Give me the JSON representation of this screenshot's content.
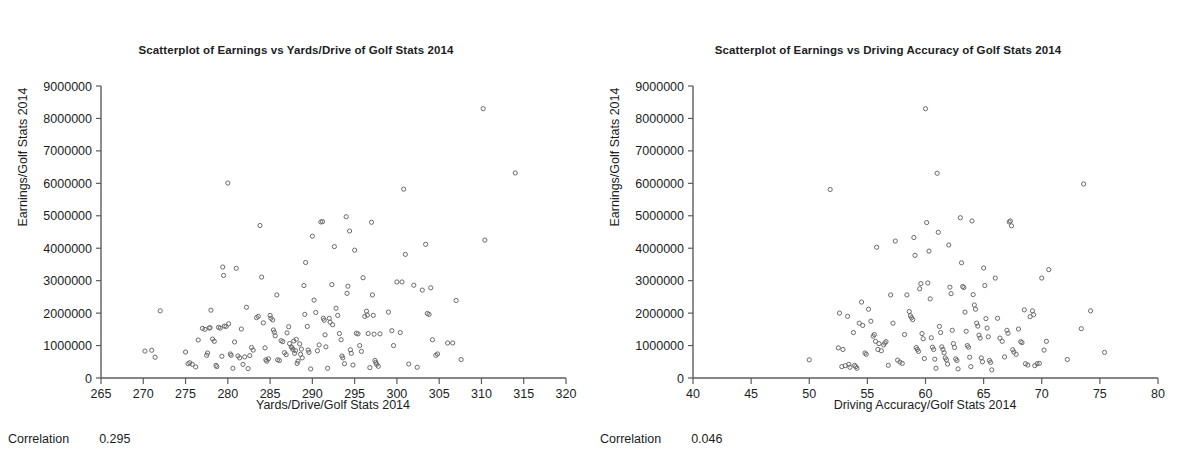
{
  "chart_data": [
    {
      "type": "scatter",
      "id": "earnings-vs-yards-drive",
      "title": "Scatterplot of Earnings vs Yards/Drive of Golf Stats 2014",
      "xlabel": "Yards/Drive/Golf Stats 2014",
      "ylabel": "Earnings/Golf Stats 2014",
      "xlim": [
        265,
        320
      ],
      "ylim": [
        0,
        9000000
      ],
      "xticks": [
        265,
        270,
        275,
        280,
        285,
        290,
        295,
        300,
        305,
        310,
        315,
        320
      ],
      "yticks": [
        0,
        1000000,
        2000000,
        3000000,
        4000000,
        5000000,
        6000000,
        7000000,
        8000000,
        9000000
      ],
      "ytick_labels": [
        "0",
        "1000000",
        "2000000",
        "3000000",
        "4000000",
        "5000000",
        "6000000",
        "7000000",
        "8000000",
        "9000000"
      ],
      "xtick_labels": [
        "265",
        "270",
        "275",
        "280",
        "285",
        "290",
        "295",
        "300",
        "305",
        "310",
        "315",
        "320"
      ],
      "grid": false,
      "legend": "none",
      "marker": "open-circle",
      "marker_color": "#6a6a6a",
      "correlation_label": "Correlation",
      "correlation_value": "0.295",
      "points": [
        [
          270.2,
          830000
        ],
        [
          271.0,
          855000
        ],
        [
          271.4,
          640000
        ],
        [
          272.0,
          2070000
        ],
        [
          275.0,
          800000
        ],
        [
          275.3,
          440000
        ],
        [
          275.5,
          470000
        ],
        [
          275.8,
          420000
        ],
        [
          276.2,
          340000
        ],
        [
          276.5,
          1170000
        ],
        [
          277.0,
          1530000
        ],
        [
          277.3,
          1500000
        ],
        [
          277.5,
          700000
        ],
        [
          277.6,
          770000
        ],
        [
          277.8,
          1540000
        ],
        [
          277.9,
          1550000
        ],
        [
          278.0,
          2090000
        ],
        [
          278.2,
          1200000
        ],
        [
          278.4,
          1130000
        ],
        [
          278.6,
          390000
        ],
        [
          278.7,
          350000
        ],
        [
          278.9,
          1560000
        ],
        [
          279.1,
          1540000
        ],
        [
          279.3,
          670000
        ],
        [
          279.4,
          3420000
        ],
        [
          279.5,
          3160000
        ],
        [
          279.6,
          1600000
        ],
        [
          279.8,
          1590000
        ],
        [
          280.0,
          6010000
        ],
        [
          280.1,
          1670000
        ],
        [
          280.3,
          740000
        ],
        [
          280.4,
          700000
        ],
        [
          280.6,
          300000
        ],
        [
          280.8,
          1110000
        ],
        [
          281.0,
          3380000
        ],
        [
          281.2,
          680000
        ],
        [
          281.4,
          620000
        ],
        [
          281.6,
          1510000
        ],
        [
          281.8,
          420000
        ],
        [
          282.0,
          650000
        ],
        [
          282.2,
          2180000
        ],
        [
          282.4,
          290000
        ],
        [
          282.6,
          690000
        ],
        [
          282.8,
          940000
        ],
        [
          283.0,
          860000
        ],
        [
          283.4,
          1860000
        ],
        [
          283.6,
          1900000
        ],
        [
          283.8,
          4700000
        ],
        [
          284.0,
          3110000
        ],
        [
          284.2,
          1700000
        ],
        [
          284.4,
          930000
        ],
        [
          284.5,
          560000
        ],
        [
          284.6,
          520000
        ],
        [
          284.8,
          590000
        ],
        [
          285.0,
          1930000
        ],
        [
          285.1,
          1840000
        ],
        [
          285.3,
          1790000
        ],
        [
          285.4,
          1480000
        ],
        [
          285.5,
          1410000
        ],
        [
          285.6,
          1300000
        ],
        [
          285.8,
          2560000
        ],
        [
          285.9,
          560000
        ],
        [
          286.1,
          540000
        ],
        [
          286.3,
          1150000
        ],
        [
          286.5,
          1120000
        ],
        [
          286.7,
          780000
        ],
        [
          286.9,
          720000
        ],
        [
          287.0,
          1390000
        ],
        [
          287.2,
          1580000
        ],
        [
          287.3,
          1060000
        ],
        [
          287.5,
          960000
        ],
        [
          287.6,
          930000
        ],
        [
          287.7,
          880000
        ],
        [
          287.8,
          1140000
        ],
        [
          287.9,
          760000
        ],
        [
          288.0,
          840000
        ],
        [
          288.1,
          1190000
        ],
        [
          288.2,
          450000
        ],
        [
          288.3,
          520000
        ],
        [
          288.5,
          1050000
        ],
        [
          288.6,
          730000
        ],
        [
          288.7,
          890000
        ],
        [
          288.8,
          620000
        ],
        [
          289.0,
          2850000
        ],
        [
          289.1,
          1960000
        ],
        [
          289.2,
          3560000
        ],
        [
          289.4,
          1590000
        ],
        [
          289.5,
          860000
        ],
        [
          289.6,
          790000
        ],
        [
          289.8,
          280000
        ],
        [
          290.0,
          4370000
        ],
        [
          290.2,
          2400000
        ],
        [
          290.4,
          2020000
        ],
        [
          290.6,
          840000
        ],
        [
          290.8,
          1020000
        ],
        [
          291.0,
          4810000
        ],
        [
          291.2,
          4820000
        ],
        [
          291.3,
          1840000
        ],
        [
          291.4,
          1780000
        ],
        [
          291.5,
          1330000
        ],
        [
          291.6,
          960000
        ],
        [
          291.8,
          300000
        ],
        [
          292.0,
          1840000
        ],
        [
          292.1,
          1720000
        ],
        [
          292.3,
          2880000
        ],
        [
          292.4,
          1640000
        ],
        [
          292.6,
          4050000
        ],
        [
          292.8,
          2150000
        ],
        [
          293.0,
          1930000
        ],
        [
          293.2,
          1370000
        ],
        [
          293.4,
          1180000
        ],
        [
          293.5,
          680000
        ],
        [
          293.6,
          620000
        ],
        [
          293.8,
          440000
        ],
        [
          294.0,
          4970000
        ],
        [
          294.1,
          2610000
        ],
        [
          294.2,
          2830000
        ],
        [
          294.4,
          4530000
        ],
        [
          294.5,
          870000
        ],
        [
          294.6,
          760000
        ],
        [
          294.8,
          400000
        ],
        [
          295.0,
          3940000
        ],
        [
          295.2,
          1380000
        ],
        [
          295.4,
          1360000
        ],
        [
          295.6,
          1000000
        ],
        [
          295.8,
          820000
        ],
        [
          296.0,
          3090000
        ],
        [
          296.2,
          1900000
        ],
        [
          296.4,
          2060000
        ],
        [
          296.5,
          1940000
        ],
        [
          296.6,
          1370000
        ],
        [
          296.8,
          320000
        ],
        [
          297.0,
          4800000
        ],
        [
          297.1,
          2560000
        ],
        [
          297.2,
          1930000
        ],
        [
          297.3,
          1350000
        ],
        [
          297.4,
          540000
        ],
        [
          297.5,
          480000
        ],
        [
          297.6,
          420000
        ],
        [
          297.8,
          360000
        ],
        [
          298.0,
          1360000
        ],
        [
          299.0,
          2030000
        ],
        [
          299.4,
          1460000
        ],
        [
          299.6,
          1000000
        ],
        [
          300.0,
          2960000
        ],
        [
          300.4,
          1400000
        ],
        [
          300.6,
          2960000
        ],
        [
          300.8,
          5820000
        ],
        [
          301.0,
          3810000
        ],
        [
          301.4,
          430000
        ],
        [
          302.0,
          2860000
        ],
        [
          302.4,
          330000
        ],
        [
          303.0,
          2710000
        ],
        [
          303.4,
          4120000
        ],
        [
          303.6,
          1990000
        ],
        [
          303.8,
          1960000
        ],
        [
          304.0,
          2780000
        ],
        [
          304.2,
          1180000
        ],
        [
          304.6,
          700000
        ],
        [
          304.8,
          740000
        ],
        [
          306.0,
          1080000
        ],
        [
          306.6,
          1080000
        ],
        [
          307.0,
          2390000
        ],
        [
          307.6,
          570000
        ],
        [
          310.2,
          8300000
        ],
        [
          310.4,
          4250000
        ],
        [
          314.0,
          6320000
        ]
      ]
    },
    {
      "type": "scatter",
      "id": "earnings-vs-driving-accuracy",
      "title": "Scatterplot of Earnings vs Driving Accuracy of Golf Stats 2014",
      "xlabel": "Driving Accuracy/Golf Stats 2014",
      "ylabel": "Earnings/Golf Stats 2014",
      "xlim": [
        40,
        80
      ],
      "ylim": [
        0,
        9000000
      ],
      "xticks": [
        40,
        45,
        50,
        55,
        60,
        65,
        70,
        75,
        80
      ],
      "yticks": [
        0,
        1000000,
        2000000,
        3000000,
        4000000,
        5000000,
        6000000,
        7000000,
        8000000,
        9000000
      ],
      "ytick_labels": [
        "0",
        "1000000",
        "2000000",
        "3000000",
        "4000000",
        "5000000",
        "6000000",
        "7000000",
        "8000000",
        "9000000"
      ],
      "xtick_labels": [
        "40",
        "45",
        "50",
        "55",
        "60",
        "65",
        "70",
        "75",
        "80"
      ],
      "grid": false,
      "legend": "none",
      "marker": "open-circle",
      "marker_color": "#6a6a6a",
      "correlation_label": "Correlation",
      "correlation_value": "0.046",
      "points": [
        [
          50.0,
          560000
        ],
        [
          51.8,
          5810000
        ],
        [
          52.5,
          930000
        ],
        [
          52.6,
          2000000
        ],
        [
          52.8,
          350000
        ],
        [
          52.9,
          880000
        ],
        [
          53.1,
          380000
        ],
        [
          53.3,
          1900000
        ],
        [
          53.4,
          420000
        ],
        [
          53.5,
          330000
        ],
        [
          53.8,
          1400000
        ],
        [
          53.9,
          390000
        ],
        [
          54.0,
          350000
        ],
        [
          54.1,
          300000
        ],
        [
          54.3,
          1690000
        ],
        [
          54.5,
          2340000
        ],
        [
          54.6,
          1620000
        ],
        [
          54.8,
          770000
        ],
        [
          54.9,
          730000
        ],
        [
          55.1,
          2120000
        ],
        [
          55.3,
          1750000
        ],
        [
          55.5,
          1290000
        ],
        [
          55.6,
          1340000
        ],
        [
          55.7,
          1130000
        ],
        [
          55.8,
          4030000
        ],
        [
          55.9,
          880000
        ],
        [
          56.0,
          1060000
        ],
        [
          56.2,
          840000
        ],
        [
          56.4,
          1020000
        ],
        [
          56.5,
          1080000
        ],
        [
          56.6,
          1120000
        ],
        [
          56.8,
          390000
        ],
        [
          57.0,
          2560000
        ],
        [
          57.2,
          1690000
        ],
        [
          57.4,
          4220000
        ],
        [
          57.6,
          550000
        ],
        [
          57.8,
          490000
        ],
        [
          58.0,
          450000
        ],
        [
          58.2,
          1340000
        ],
        [
          58.4,
          2560000
        ],
        [
          58.6,
          2050000
        ],
        [
          58.7,
          1920000
        ],
        [
          58.8,
          1860000
        ],
        [
          58.9,
          1800000
        ],
        [
          59.0,
          4330000
        ],
        [
          59.1,
          3780000
        ],
        [
          59.2,
          940000
        ],
        [
          59.3,
          880000
        ],
        [
          59.4,
          820000
        ],
        [
          59.5,
          2750000
        ],
        [
          59.6,
          2910000
        ],
        [
          59.7,
          1370000
        ],
        [
          59.8,
          1210000
        ],
        [
          59.9,
          600000
        ],
        [
          60.0,
          8300000
        ],
        [
          60.1,
          4790000
        ],
        [
          60.2,
          2930000
        ],
        [
          60.3,
          3910000
        ],
        [
          60.4,
          2440000
        ],
        [
          60.5,
          1240000
        ],
        [
          60.6,
          950000
        ],
        [
          60.7,
          880000
        ],
        [
          60.8,
          580000
        ],
        [
          60.9,
          300000
        ],
        [
          61.0,
          6310000
        ],
        [
          61.1,
          4490000
        ],
        [
          61.2,
          1590000
        ],
        [
          61.3,
          1400000
        ],
        [
          61.4,
          960000
        ],
        [
          61.5,
          880000
        ],
        [
          61.6,
          780000
        ],
        [
          61.7,
          620000
        ],
        [
          61.8,
          560000
        ],
        [
          61.9,
          430000
        ],
        [
          62.0,
          4100000
        ],
        [
          62.1,
          2800000
        ],
        [
          62.2,
          2600000
        ],
        [
          62.3,
          1470000
        ],
        [
          62.4,
          1060000
        ],
        [
          62.5,
          940000
        ],
        [
          62.6,
          590000
        ],
        [
          62.7,
          540000
        ],
        [
          62.8,
          280000
        ],
        [
          63.0,
          4940000
        ],
        [
          63.1,
          3550000
        ],
        [
          63.2,
          2820000
        ],
        [
          63.3,
          2790000
        ],
        [
          63.4,
          2030000
        ],
        [
          63.5,
          1440000
        ],
        [
          63.6,
          1000000
        ],
        [
          63.7,
          950000
        ],
        [
          63.8,
          640000
        ],
        [
          63.9,
          350000
        ],
        [
          64.0,
          4840000
        ],
        [
          64.1,
          2570000
        ],
        [
          64.2,
          2250000
        ],
        [
          64.3,
          2120000
        ],
        [
          64.4,
          1690000
        ],
        [
          64.5,
          1600000
        ],
        [
          64.6,
          1320000
        ],
        [
          64.7,
          1230000
        ],
        [
          64.8,
          620000
        ],
        [
          64.9,
          500000
        ],
        [
          65.0,
          3390000
        ],
        [
          65.1,
          2850000
        ],
        [
          65.2,
          1830000
        ],
        [
          65.3,
          1540000
        ],
        [
          65.4,
          1270000
        ],
        [
          65.5,
          540000
        ],
        [
          65.6,
          480000
        ],
        [
          65.7,
          250000
        ],
        [
          66.0,
          3080000
        ],
        [
          66.2,
          1840000
        ],
        [
          66.4,
          1230000
        ],
        [
          66.6,
          1130000
        ],
        [
          66.8,
          650000
        ],
        [
          67.0,
          1470000
        ],
        [
          67.1,
          1380000
        ],
        [
          67.2,
          4810000
        ],
        [
          67.3,
          4840000
        ],
        [
          67.4,
          4690000
        ],
        [
          67.5,
          870000
        ],
        [
          67.6,
          800000
        ],
        [
          67.8,
          730000
        ],
        [
          68.0,
          1510000
        ],
        [
          68.2,
          1120000
        ],
        [
          68.3,
          1090000
        ],
        [
          68.5,
          2100000
        ],
        [
          68.6,
          440000
        ],
        [
          68.8,
          400000
        ],
        [
          69.0,
          1890000
        ],
        [
          69.2,
          2070000
        ],
        [
          69.3,
          1950000
        ],
        [
          69.4,
          380000
        ],
        [
          69.6,
          440000
        ],
        [
          69.8,
          450000
        ],
        [
          70.0,
          3080000
        ],
        [
          70.2,
          860000
        ],
        [
          70.4,
          1130000
        ],
        [
          70.6,
          3340000
        ],
        [
          72.2,
          570000
        ],
        [
          73.4,
          1520000
        ],
        [
          73.6,
          5980000
        ],
        [
          74.2,
          2070000
        ],
        [
          75.4,
          790000
        ]
      ]
    }
  ]
}
